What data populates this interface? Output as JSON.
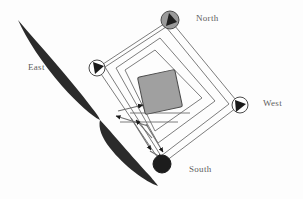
{
  "figure": {
    "type": "diagram",
    "title": "",
    "background_color": "#fdfdfd",
    "width": 303,
    "height": 199
  },
  "labels": {
    "north": "North",
    "east": "East",
    "west": "West",
    "south": "South"
  },
  "colors": {
    "stroke": "#4a4a4a",
    "path_stroke": "#6e6e6e",
    "center_square_fill": "#a0a0a0",
    "center_square_stroke": "#4a4a4a",
    "node_north_fill": "#9a9a9a",
    "node_east_fill": "#ffffff",
    "node_west_fill": "#ffffff",
    "node_south_fill": "#1c1c1c",
    "blade_fill": "#2b2b2b",
    "arrow_fill": "#1a1a1a",
    "label_color": "#5e5e5e"
  },
  "nodes": [
    {
      "name": "north",
      "label": "North",
      "x": 170,
      "y": 20,
      "r": 9,
      "fill": "#9a9a9a",
      "filled": true,
      "has_arrowhead": true
    },
    {
      "name": "east",
      "label": "East",
      "x": 97,
      "y": 68,
      "r": 8,
      "fill": "#ffffff",
      "filled": false,
      "has_arrowhead": true
    },
    {
      "name": "west",
      "label": "West",
      "x": 240,
      "y": 105,
      "r": 8,
      "fill": "#ffffff",
      "filled": false,
      "has_arrowhead": true
    },
    {
      "name": "south",
      "label": "South",
      "x": 162,
      "y": 164,
      "r": 9,
      "fill": "#1c1c1c",
      "filled": true,
      "has_arrowhead": false
    }
  ],
  "center_square": {
    "name": "center-square",
    "cx": 160,
    "cy": 92,
    "size": 38,
    "rotation_deg": -12
  },
  "spiral": {
    "description": "nested rotated square path spiralling inward from the compass nodes to the centre square",
    "turns": 3,
    "rotation_deg": -12,
    "arrowhead_count": 7
  },
  "blades": {
    "description": "two dark elongated leaf/blade shapes forming an S across the left of the figure",
    "count": 2,
    "fill": "#2b2b2b"
  }
}
